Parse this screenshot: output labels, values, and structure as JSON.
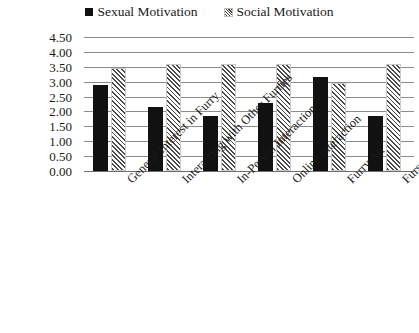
{
  "legend": {
    "position": "top-center",
    "entries": [
      {
        "label": "Sexual Motivation",
        "marker": "filled-square-icon",
        "color": "#111111"
      },
      {
        "label": "Social Motivation",
        "marker": "hatched-square-icon",
        "color": "#4a4a4a"
      }
    ]
  },
  "axis": {
    "y_ticks": [
      "4.50",
      "4.00",
      "3.50",
      "3.00",
      "2.50",
      "2.00",
      "1.50",
      "1.00",
      "0.50",
      "0.00"
    ]
  },
  "chart_data": {
    "type": "bar",
    "title": "",
    "subtitle": "",
    "xlabel": "",
    "ylabel": "",
    "ylim": [
      0,
      4.5
    ],
    "ytick_step": 0.5,
    "grid": true,
    "legend_position": "top-center",
    "categories": [
      "General Interest in Furry",
      "Interacting with Other Furries",
      "In-Person Interaction",
      "Online Interaction",
      "Furry Art",
      "Fursuiting"
    ],
    "series": [
      {
        "name": "Sexual Motivation",
        "color": "#111111",
        "fill": "solid",
        "values": [
          2.9,
          2.15,
          1.85,
          2.3,
          3.15,
          1.85
        ]
      },
      {
        "name": "Social Motivation",
        "color": "#4a4a4a",
        "fill": "diagonal-hatch",
        "values": [
          3.45,
          3.6,
          3.6,
          3.6,
          2.95,
          3.6
        ]
      }
    ]
  }
}
